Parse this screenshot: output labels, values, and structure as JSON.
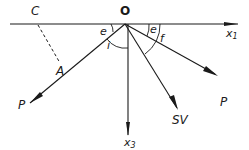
{
  "diagram": {
    "type": "ray reflection geometry",
    "colors": {
      "line": "#1a1a1a",
      "background": "#ffffff"
    },
    "labels": {
      "origin": "O",
      "point_c": "C",
      "point_a": "A",
      "incident_p": "P",
      "reflected_p": "P",
      "converted_sv": "SV",
      "axis_x1_base": "x",
      "axis_x1_sub": "1",
      "axis_x3_base": "x",
      "axis_x3_sub": "3",
      "angle_e_left": "e",
      "angle_i": "i",
      "angle_e_right": "e",
      "angle_f": "f"
    },
    "elements": [
      {
        "id": "surface-x1-axis",
        "from": "left edge",
        "to": "x1 arrow",
        "style": "solid"
      },
      {
        "id": "incident-ray",
        "from": "P",
        "through": "A",
        "to": "O",
        "style": "solid"
      },
      {
        "id": "wavefront-ca",
        "from": "C",
        "to": "A",
        "style": "dashed"
      },
      {
        "id": "reflected-p-ray",
        "from": "O",
        "to": "P",
        "style": "solid"
      },
      {
        "id": "converted-sv-ray",
        "from": "O",
        "to": "SV",
        "style": "solid"
      },
      {
        "id": "x3-axis",
        "from": "O",
        "to": "x3",
        "style": "solid"
      }
    ]
  }
}
